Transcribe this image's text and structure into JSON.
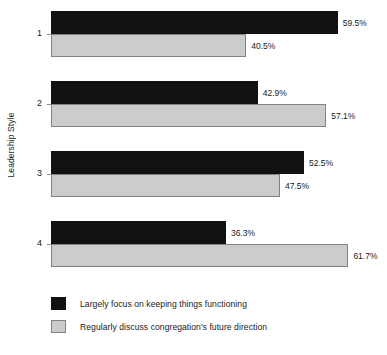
{
  "chart_data": {
    "type": "bar",
    "orientation": "horizontal",
    "title": "",
    "subtitle": "",
    "xlabel": "",
    "ylabel": "Leadership Style",
    "categories": [
      "1",
      "2",
      "3",
      "4"
    ],
    "series": [
      {
        "name": "Largely focus on keeping things functioning",
        "color": "#111111",
        "values": [
          59.5,
          42.9,
          52.5,
          36.3
        ],
        "labels": [
          "59.5%",
          "42.9%",
          "52.5%",
          "36.3%"
        ]
      },
      {
        "name": "Regularly discuss congregation's future direction",
        "color": "#cccccc",
        "values": [
          40.5,
          57.1,
          47.5,
          61.7
        ],
        "labels": [
          "40.5%",
          "57.1%",
          "47.5%",
          "61.7%"
        ]
      }
    ],
    "xlim": [
      0,
      65
    ],
    "grid": false,
    "legend_position": "bottom-left",
    "value_labels_shown": true
  },
  "axis": {
    "y_title": "Leadership Style",
    "category_labels": [
      "1",
      "2",
      "3",
      "4"
    ]
  },
  "legend": {
    "items": [
      {
        "label": "Largely focus on keeping things functioning",
        "swatch": "black-swatch"
      },
      {
        "label": "Regularly discuss congregation's future direction",
        "swatch": "gray-swatch"
      }
    ]
  }
}
